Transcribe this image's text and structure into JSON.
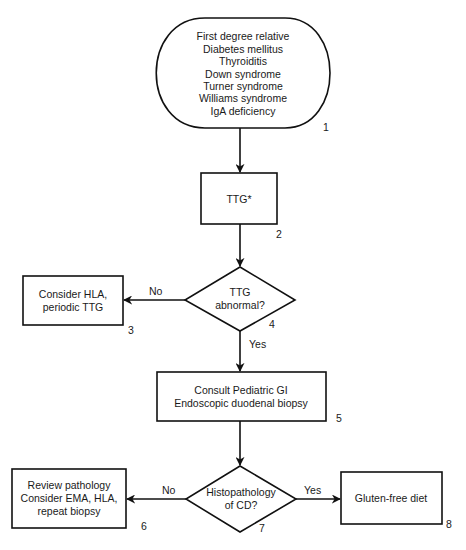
{
  "diagram": {
    "type": "flowchart",
    "nodes": {
      "n1": {
        "number": "1",
        "shape": "terminator",
        "lines": [
          "First degree relative",
          "Diabetes mellitus",
          "Thyroiditis",
          "Down syndrome",
          "Turner syndrome",
          "Williams syndrome",
          "IgA deficiency"
        ]
      },
      "n2": {
        "number": "2",
        "shape": "process",
        "lines": [
          "TTG*"
        ]
      },
      "n3": {
        "number": "3",
        "shape": "process",
        "lines": [
          "Consider HLA,",
          "periodic TTG"
        ]
      },
      "n4": {
        "number": "4",
        "shape": "decision",
        "lines": [
          "TTG",
          "abnormal?"
        ]
      },
      "n5": {
        "number": "5",
        "shape": "process",
        "lines": [
          "Consult Pediatric GI",
          "Endoscopic duodenal biopsy"
        ]
      },
      "n6": {
        "number": "6",
        "shape": "process",
        "lines": [
          "Review pathology",
          "Consider EMA, HLA,",
          "repeat biopsy"
        ]
      },
      "n7": {
        "number": "7",
        "shape": "decision",
        "lines": [
          "Histopathology",
          "of CD?"
        ]
      },
      "n8": {
        "number": "8",
        "shape": "process",
        "lines": [
          "Gluten-free diet"
        ]
      }
    },
    "edges": [
      {
        "from": "n1",
        "to": "n2",
        "label": ""
      },
      {
        "from": "n2",
        "to": "n4",
        "label": ""
      },
      {
        "from": "n4",
        "to": "n3",
        "label": "No"
      },
      {
        "from": "n4",
        "to": "n5",
        "label": "Yes"
      },
      {
        "from": "n5",
        "to": "n7",
        "label": ""
      },
      {
        "from": "n7",
        "to": "n6",
        "label": "No"
      },
      {
        "from": "n7",
        "to": "n8",
        "label": "Yes"
      }
    ],
    "colors": {
      "stroke": "#111111",
      "fill": "#ffffff",
      "text": "#1a1a1a"
    }
  }
}
